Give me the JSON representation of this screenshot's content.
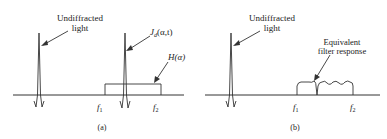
{
  "panels": [
    {
      "id": "a",
      "caption": "(a)",
      "labels": {
        "undiffracted": [
          "Undiffracted",
          "light"
        ],
        "signal": "J",
        "signal_sub": "d",
        "signal_args": "(α,t)",
        "filter": "H(α)",
        "f1": "f",
        "f1_sub": "1",
        "f2": "f",
        "f2_sub": "2"
      }
    },
    {
      "id": "b",
      "caption": "(b)",
      "labels": {
        "undiffracted": [
          "Undiffracted",
          "light"
        ],
        "response": [
          "Equivalent",
          "filter response"
        ],
        "f1": "f",
        "f1_sub": "1",
        "f2": "f",
        "f2_sub": "2"
      }
    }
  ],
  "colors": {
    "ink": "#333333",
    "background": "#ffffff"
  }
}
